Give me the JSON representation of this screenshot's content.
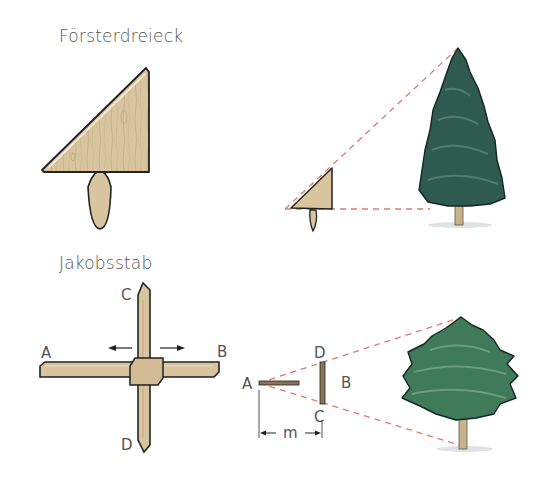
{
  "sections": [
    {
      "title": "Försterdreieck",
      "illustration": "forester-triangle",
      "application": "measuring tree height with a right isosceles triangle on a handle"
    },
    {
      "title": "Jakobsstab",
      "illustration": "jacobs-staff",
      "labels": {
        "a": "A",
        "b": "B",
        "c": "C",
        "d": "D"
      },
      "application_labels": {
        "a": "A",
        "b": "B",
        "c": "C",
        "d": "D",
        "m": "m"
      }
    }
  ],
  "colors": {
    "wood": "#d9c4a0",
    "wood_dark": "#b89f78",
    "outline": "#222222",
    "sight_line": "#e07a6a",
    "spruce": "#2e5a4f",
    "pine": "#3f7a5a",
    "trunk": "#c9b28a",
    "text": "#555555"
  }
}
